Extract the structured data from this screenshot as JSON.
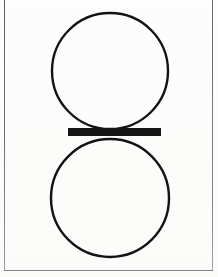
{
  "figure": {
    "background_color": "#fdfdfc",
    "ink_color": "#131313",
    "frame_color": "#6e6f72",
    "canvas": {
      "width": 218,
      "height": 277
    },
    "frame": {
      "left_x": 4,
      "right_x": 212,
      "bottom_y": 270,
      "line_width": 1
    },
    "shapes": [
      {
        "name": "upper-circle",
        "type": "circle",
        "cx": 110,
        "cy": 71,
        "r": 58,
        "stroke_width": 2.4,
        "fill": "none"
      },
      {
        "name": "lower-circle",
        "type": "circle",
        "cx": 110,
        "cy": 198,
        "r": 59,
        "stroke_width": 2.4,
        "fill": "none"
      },
      {
        "name": "center-bar",
        "type": "rect",
        "x": 68,
        "y": 128,
        "width": 93,
        "height": 8,
        "fill": "#151515"
      }
    ]
  }
}
